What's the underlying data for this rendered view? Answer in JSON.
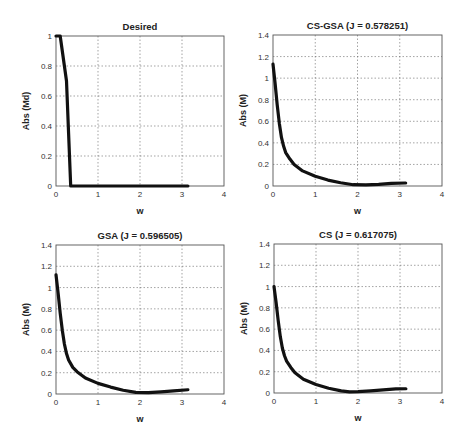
{
  "chart_data": [
    {
      "type": "line",
      "title": "Desired",
      "xlabel": "w",
      "ylabel": "Abs (Md)",
      "xlim": [
        0,
        4
      ],
      "ylim": [
        0,
        1
      ],
      "xticks": [
        "0",
        "1",
        "2",
        "3",
        "4"
      ],
      "yticks": [
        "0",
        "0.2",
        "0.4",
        "0.6",
        "0.8",
        "1"
      ],
      "ytick_values": [
        0,
        0.2,
        0.4,
        0.6,
        0.8,
        1
      ],
      "grid": true,
      "series": [
        {
          "name": "Md",
          "x": [
            0,
            0.1,
            0.2,
            0.25,
            0.3,
            0.35,
            0.5,
            1.0,
            1.5,
            2.0,
            2.5,
            3.0,
            3.14
          ],
          "y": [
            1,
            1,
            0.8,
            0.7,
            0.35,
            0,
            0,
            0,
            0,
            0,
            0,
            0,
            0
          ]
        }
      ]
    },
    {
      "type": "line",
      "title": "CS-GSA (J = 0.578251)",
      "xlabel": "w",
      "ylabel": "Abs (M)",
      "xlim": [
        0,
        4
      ],
      "ylim": [
        0,
        1.4
      ],
      "xticks": [
        "0",
        "1",
        "2",
        "3",
        "4"
      ],
      "yticks": [
        "0",
        "0.2",
        "0.4",
        "0.6",
        "0.8",
        "1",
        "1.2",
        "1.4"
      ],
      "ytick_values": [
        0,
        0.2,
        0.4,
        0.6,
        0.8,
        1,
        1.2,
        1.4
      ],
      "grid": true,
      "series": [
        {
          "name": "M",
          "x": [
            0,
            0.05,
            0.1,
            0.15,
            0.2,
            0.25,
            0.3,
            0.4,
            0.5,
            0.7,
            1.0,
            1.3,
            1.6,
            1.9,
            2.2,
            2.5,
            2.8,
            3.14
          ],
          "y": [
            1.13,
            0.95,
            0.75,
            0.58,
            0.45,
            0.37,
            0.31,
            0.25,
            0.2,
            0.14,
            0.09,
            0.055,
            0.03,
            0.012,
            0.01,
            0.015,
            0.025,
            0.028
          ]
        }
      ]
    },
    {
      "type": "line",
      "title": "GSA (J = 0.596505)",
      "xlabel": "w",
      "ylabel": "Abs (M)",
      "xlim": [
        0,
        4
      ],
      "ylim": [
        0,
        1.4
      ],
      "xticks": [
        "0",
        "1",
        "2",
        "3",
        "4"
      ],
      "yticks": [
        "0",
        "0.2",
        "0.4",
        "0.6",
        "0.8",
        "1",
        "1.2",
        "1.4"
      ],
      "ytick_values": [
        0,
        0.2,
        0.4,
        0.6,
        0.8,
        1,
        1.2,
        1.4
      ],
      "grid": true,
      "series": [
        {
          "name": "M",
          "x": [
            0,
            0.05,
            0.1,
            0.15,
            0.2,
            0.25,
            0.3,
            0.4,
            0.5,
            0.7,
            1.0,
            1.3,
            1.6,
            1.9,
            2.2,
            2.5,
            2.8,
            3.14
          ],
          "y": [
            1.12,
            0.95,
            0.76,
            0.6,
            0.47,
            0.38,
            0.32,
            0.25,
            0.21,
            0.15,
            0.1,
            0.065,
            0.035,
            0.015,
            0.012,
            0.02,
            0.03,
            0.04
          ]
        }
      ]
    },
    {
      "type": "line",
      "title": "CS (J = 0.617075)",
      "xlabel": "w",
      "ylabel": "Abs (M)",
      "xlim": [
        0,
        4
      ],
      "ylim": [
        0,
        1.4
      ],
      "xticks": [
        "0",
        "1",
        "2",
        "3",
        "4"
      ],
      "yticks": [
        "0",
        "0.2",
        "0.4",
        "0.6",
        "0.8",
        "1",
        "1.2",
        "1.4"
      ],
      "ytick_values": [
        0,
        0.2,
        0.4,
        0.6,
        0.8,
        1,
        1.2,
        1.4
      ],
      "grid": true,
      "series": [
        {
          "name": "M",
          "x": [
            0,
            0.05,
            0.1,
            0.15,
            0.2,
            0.25,
            0.3,
            0.4,
            0.5,
            0.7,
            1.0,
            1.3,
            1.6,
            1.8,
            2.0,
            2.3,
            2.6,
            2.9,
            3.14
          ],
          "y": [
            1.0,
            0.85,
            0.68,
            0.53,
            0.42,
            0.35,
            0.3,
            0.24,
            0.19,
            0.13,
            0.08,
            0.045,
            0.02,
            0.01,
            0.012,
            0.02,
            0.03,
            0.038,
            0.04
          ]
        }
      ]
    }
  ]
}
